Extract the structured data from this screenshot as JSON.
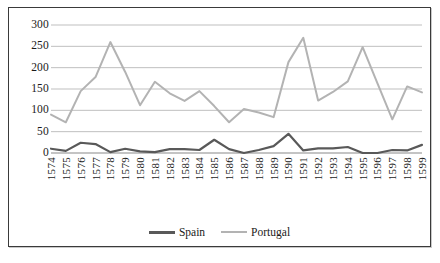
{
  "chart_data": {
    "type": "line",
    "title": "",
    "subtitle": "",
    "xlabel": "",
    "ylabel": "",
    "categories": [
      "1574",
      "1575",
      "1576",
      "1577",
      "1578",
      "1579",
      "1580",
      "1581",
      "1582",
      "1583",
      "1584",
      "1585",
      "1586",
      "1587",
      "1588",
      "1589",
      "1590",
      "1591",
      "1592",
      "1593",
      "1594",
      "1595",
      "1596",
      "1597",
      "1598",
      "1599"
    ],
    "series": [
      {
        "name": "Spain",
        "color": "#595959",
        "values": [
          10,
          5,
          24,
          21,
          2,
          10,
          4,
          2,
          9,
          9,
          7,
          31,
          9,
          0,
          7,
          16,
          45,
          6,
          11,
          11,
          14,
          0,
          0,
          7,
          6,
          19
        ]
      },
      {
        "name": "Portugal",
        "color": "#b3b3b3",
        "values": [
          90,
          72,
          145,
          178,
          260,
          190,
          112,
          167,
          140,
          122,
          145,
          110,
          72,
          103,
          95,
          84,
          213,
          270,
          123,
          143,
          168,
          248,
          163,
          79,
          156,
          142
        ]
      }
    ],
    "ylim": [
      0,
      300
    ],
    "yticks": [
      0,
      50,
      100,
      150,
      200,
      250,
      300
    ],
    "ytick_labels": [
      "0",
      "50",
      "100",
      "150",
      "200",
      "250",
      "300"
    ],
    "grid": true,
    "grid_color": "#b8b8b8",
    "legend_position": "bottom",
    "border_color": "#3a3a3a",
    "background": "#ffffff"
  },
  "legend": {
    "items": [
      {
        "label": "Spain"
      },
      {
        "label": "Portugal"
      }
    ]
  }
}
